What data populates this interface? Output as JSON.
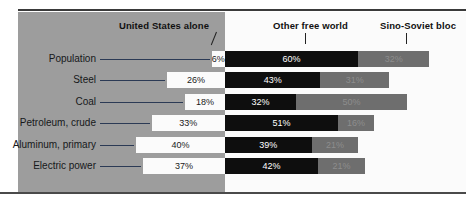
{
  "chart_data": {
    "type": "bar",
    "subtype": "stacked-horizontal-100-percent",
    "title": "",
    "xlabel": "",
    "ylabel": "",
    "grid": false,
    "legend_position": "top",
    "units": "percent of world total",
    "baseline_note": "United States alone segment extends left of the divider; Other free world and Sino-Soviet bloc extend right",
    "categories": [
      "Population",
      "Steel",
      "Coal",
      "Petroleum, crude",
      "Aluminum, primary",
      "Electric power"
    ],
    "series": [
      {
        "name": "United States alone",
        "color": "#fbfbfb",
        "values": [
          6,
          26,
          18,
          33,
          40,
          37
        ],
        "labels": [
          "6%",
          "26%",
          "18%",
          "33%",
          "40%",
          "37%"
        ]
      },
      {
        "name": "Other free world",
        "color": "#0e0e0e",
        "values": [
          60,
          43,
          32,
          51,
          39,
          42
        ],
        "labels": [
          "60%",
          "43%",
          "32%",
          "51%",
          "39%",
          "42%"
        ]
      },
      {
        "name": "Sino-Soviet bloc",
        "color": "#6e6e6e",
        "values": [
          32,
          31,
          50,
          16,
          21,
          21
        ],
        "labels": [
          "32%",
          "31%",
          "50%",
          "16%",
          "21%",
          "21%"
        ]
      }
    ],
    "xlim": [
      0,
      100
    ]
  },
  "headers": {
    "united_states": "United States alone",
    "other_free_world": "Other free world",
    "sino_soviet": "Sino-Soviet bloc"
  },
  "rows": [
    {
      "label": "Population",
      "us": "6%",
      "ofw": "60%",
      "ssb": "32%"
    },
    {
      "label": "Steel",
      "us": "26%",
      "ofw": "43%",
      "ssb": "31%"
    },
    {
      "label": "Coal",
      "us": "18%",
      "ofw": "32%",
      "ssb": "50%"
    },
    {
      "label": "Petroleum, crude",
      "us": "33%",
      "ofw": "51%",
      "ssb": "16%"
    },
    {
      "label": "Aluminum, primary",
      "us": "40%",
      "ofw": "39%",
      "ssb": "21%"
    },
    {
      "label": "Electric power",
      "us": "37%",
      "ofw": "42%",
      "ssb": "21%"
    }
  ],
  "colors": {
    "panel_left": "#9d9d9d",
    "panel_right": "#fbfbfb",
    "us_bar": "#fbfbfb",
    "other_free_world_bar": "#0e0e0e",
    "sino_soviet_bar": "#6e6e6e",
    "rule": "#3a3a3a",
    "leader_line": "#2b3a55"
  }
}
